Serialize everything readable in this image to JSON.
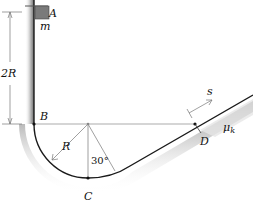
{
  "diagram": {
    "labels": {
      "A": "A",
      "m": "m",
      "height": "2R",
      "B": "B",
      "R": "R",
      "angle": "30°",
      "C": "C",
      "D": "D",
      "s": "s",
      "mu": "μ",
      "mu_sub": "k"
    },
    "colors": {
      "track": "#222222",
      "shadow": "#9a9a9a",
      "block": "#7a7a7a",
      "guide": "#888888"
    }
  }
}
